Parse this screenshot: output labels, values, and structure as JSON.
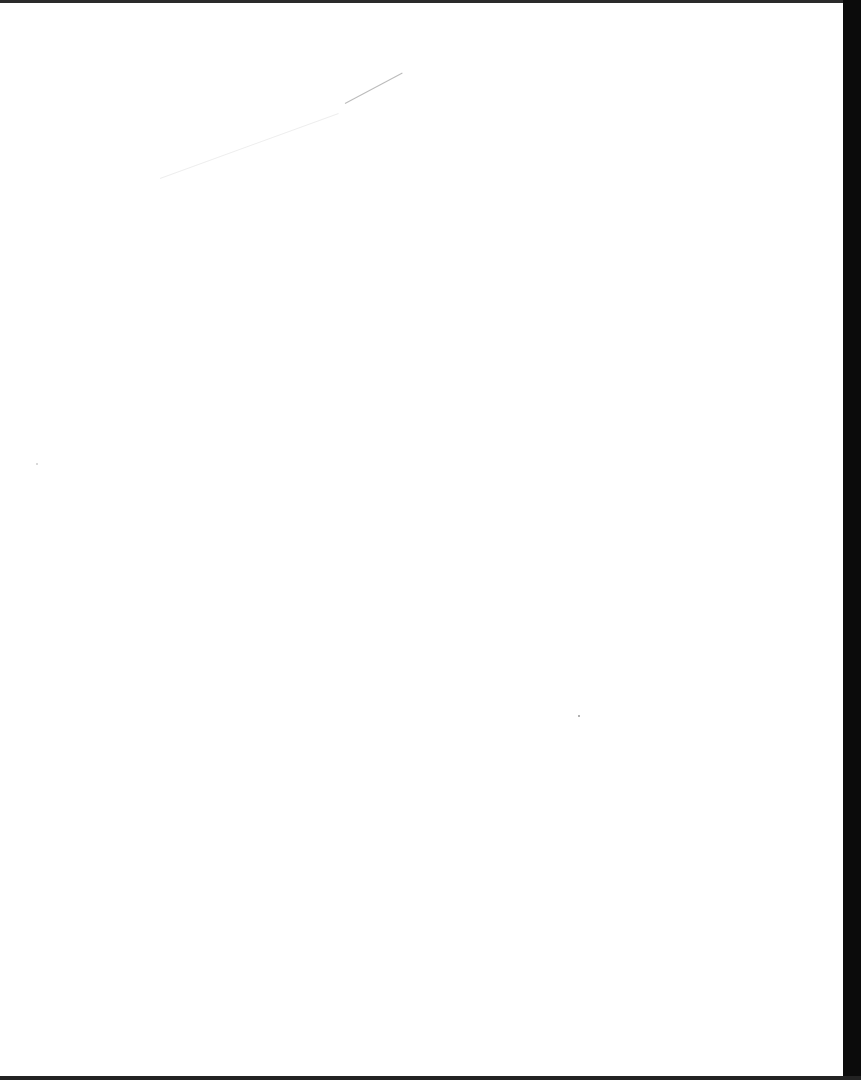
{
  "document": {
    "type": "scanned-page",
    "content": "",
    "colors": {
      "paper": "#ffffff",
      "scan_border": "#0b0b0b"
    }
  }
}
